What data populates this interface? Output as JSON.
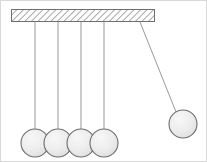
{
  "figure": {
    "width": 207,
    "height": 162,
    "background_color": "#ffffff",
    "border_color": "#d8d8d8"
  },
  "support_bar": {
    "label": "support-bar",
    "x": 11,
    "y": 9,
    "width": 144,
    "height": 13,
    "fill_color": "#fbfbfb",
    "stroke_color": "#6f6f6f",
    "hatch_color": "#8a8a8a",
    "hatch_spacing": 3.2,
    "hatch_angle_deg": 45
  },
  "strings": {
    "stroke_color": "#8d8d8d",
    "stroke_width": 0.9,
    "hanging": [
      {
        "label": "string-1",
        "x1": 35,
        "y1": 22,
        "x2": 35,
        "y2": 131
      },
      {
        "label": "string-2",
        "x1": 58,
        "y1": 22,
        "x2": 58,
        "y2": 131
      },
      {
        "label": "string-3",
        "x1": 81,
        "y1": 22,
        "x2": 81,
        "y2": 131
      },
      {
        "label": "string-4",
        "x1": 104,
        "y1": 22,
        "x2": 104,
        "y2": 131
      }
    ],
    "raised": {
      "label": "string-5-raised",
      "x1": 140,
      "y1": 22,
      "x2": 176,
      "y2": 112
    }
  },
  "balls": {
    "fill_color": "#ededed",
    "stroke_color": "#6d6d6d",
    "highlight_color": "#f8f8f8",
    "radius": 14,
    "resting": [
      {
        "label": "ball-1",
        "cx": 35,
        "cy": 143
      },
      {
        "label": "ball-2",
        "cx": 58,
        "cy": 143
      },
      {
        "label": "ball-3",
        "cx": 81,
        "cy": 143
      },
      {
        "label": "ball-4",
        "cx": 104,
        "cy": 143
      }
    ],
    "raised": {
      "label": "ball-5-raised",
      "cx": 183,
      "cy": 124
    }
  }
}
